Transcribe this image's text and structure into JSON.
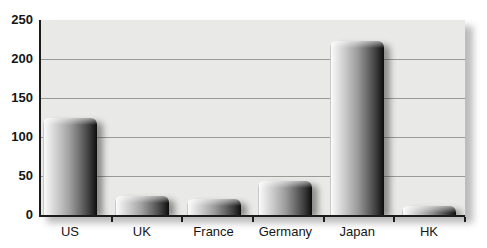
{
  "chart_data": {
    "type": "bar",
    "categories": [
      "US",
      "UK",
      "France",
      "Germany",
      "Japan",
      "HK"
    ],
    "values": [
      124,
      25,
      20,
      44,
      223,
      11
    ],
    "title": "",
    "xlabel": "",
    "ylabel": "",
    "ylim": [
      0,
      250
    ],
    "yticks": [
      0,
      50,
      100,
      150,
      200,
      250
    ],
    "grid": true,
    "legend": false,
    "bar_style": "glossy-3d-gradient",
    "plot_background": "#e9e9e7"
  },
  "colors": {
    "page_bg": "#ffffff",
    "plot_bg": "#e9e9e7",
    "gridline": "#9a9a98",
    "axis": "#1c1c1c",
    "label_text": "#161616",
    "bar_gradient_stops": [
      "#9b9b9b 0%",
      "#fbfbfb 2%",
      "#ebebeb 10%",
      "#c6c6c6 30%",
      "#9e9e9e 50%",
      "#696969 70%",
      "#383838 87%",
      "#0d0d0d 100%"
    ],
    "bar_top_highlight": "rgba(255,255,255,0.55)",
    "bar_shadow": "rgba(30,30,30,0.45)",
    "plot_shadow": "rgba(60,60,60,0.35)"
  }
}
